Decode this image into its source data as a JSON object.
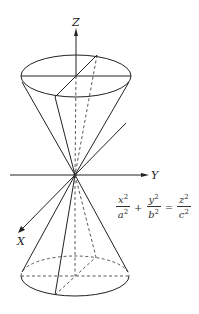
{
  "figure": {
    "type": "double cone diagram",
    "axes": {
      "z_label": "Z",
      "y_label": "Y",
      "x_label": "X"
    },
    "equation": {
      "term1": {
        "num": "x",
        "num_exp": "2",
        "den": "a",
        "den_exp": "2"
      },
      "op1": "+",
      "term2": {
        "num": "y",
        "num_exp": "2",
        "den": "b",
        "den_exp": "2"
      },
      "op2": "=",
      "term3": {
        "num": "z",
        "num_exp": "2",
        "den": "c",
        "den_exp": "2"
      }
    },
    "colors": {
      "line": "#222222",
      "background": "#ffffff"
    }
  }
}
